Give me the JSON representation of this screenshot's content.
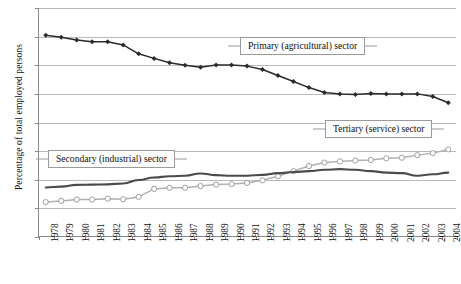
{
  "chart_data": {
    "type": "line",
    "title": "",
    "xlabel": "",
    "ylabel": "Percentage of total employed persons",
    "ylim": [
      0,
      80
    ],
    "ytick_values": [
      0,
      10,
      20,
      30,
      40,
      50,
      60,
      70,
      80
    ],
    "ytick_labels": [
      "0",
      "10",
      "20",
      "30",
      "40",
      "50",
      "60",
      "70",
      "80"
    ],
    "grid": true,
    "legend_position": "inline-callouts",
    "categories": [
      "1978",
      "1979",
      "1980",
      "1981",
      "1982",
      "1983",
      "1984",
      "1985",
      "1986",
      "1987",
      "1988",
      "1989",
      "1990",
      "1991",
      "1992",
      "1993",
      "1994",
      "1995",
      "1996",
      "1997",
      "1998",
      "1999",
      "2000",
      "2001",
      "2002",
      "2003",
      "2004"
    ],
    "series": [
      {
        "name": "Primary (agricultural) sector",
        "marker": "filled-diamond",
        "color": "#2b2b2b",
        "values": [
          70.5,
          69.8,
          68.8,
          68.2,
          68.2,
          67.1,
          64.0,
          62.4,
          60.9,
          60.0,
          59.3,
          60.1,
          60.1,
          59.7,
          58.5,
          56.4,
          54.3,
          52.2,
          50.5,
          50.0,
          49.8,
          50.1,
          50.0,
          50.0,
          50.0,
          49.1,
          46.9
        ]
      },
      {
        "name": "Secondary (industrial) sector",
        "marker": "none",
        "color": "#4a4a4a",
        "values": [
          17.3,
          17.6,
          18.2,
          18.3,
          18.4,
          18.7,
          19.9,
          20.8,
          21.2,
          21.4,
          22.2,
          21.6,
          21.4,
          21.4,
          21.7,
          22.3,
          22.7,
          23.0,
          23.5,
          23.7,
          23.5,
          23.0,
          22.5,
          22.3,
          21.4,
          21.9,
          22.5
        ]
      },
      {
        "name": "Tertiary (service) sector",
        "marker": "open-circle",
        "color": "#b0b0b0",
        "values": [
          12.2,
          12.6,
          13.1,
          13.1,
          13.4,
          13.2,
          14.0,
          16.8,
          17.2,
          17.2,
          17.8,
          18.3,
          18.5,
          18.9,
          19.8,
          21.2,
          23.0,
          24.8,
          26.0,
          26.4,
          26.7,
          26.9,
          27.5,
          27.7,
          28.6,
          29.3,
          30.6
        ]
      }
    ],
    "annotations": [
      {
        "text": "Primary (agricultural) sector",
        "target_series": "Primary (agricultural) sector"
      },
      {
        "text": "Secondary (industrial) sector",
        "target_series": "Secondary (industrial) sector"
      },
      {
        "text": "Tertiary (service) sector",
        "target_series": "Tertiary (service) sector"
      }
    ]
  }
}
